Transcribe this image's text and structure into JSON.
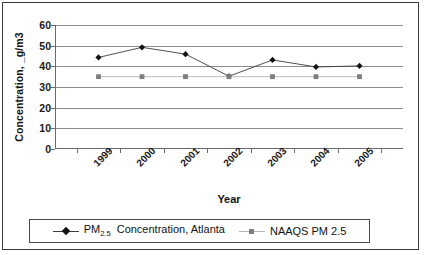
{
  "chart_data": {
    "type": "line",
    "title": "",
    "xlabel": "Year",
    "ylabel": "Concentration, _g/m3",
    "categories": [
      "1999",
      "2000",
      "2001",
      "2002",
      "2003",
      "2004",
      "2005"
    ],
    "ylim": [
      0,
      60
    ],
    "yticks": [
      0,
      10,
      20,
      30,
      40,
      50,
      60
    ],
    "grid": true,
    "legend_position": "bottom",
    "series": [
      {
        "name": "PM2.5 Concentration, Atlanta",
        "legend_label_main": "PM",
        "legend_label_sub": "2.5",
        "legend_label_rest": "Concentration, Atlanta",
        "marker": "diamond",
        "color": "#121212",
        "values": [
          44.3,
          49.2,
          45.9,
          35.2,
          43.1,
          39.7,
          40.2
        ]
      },
      {
        "name": "NAAQS PM 2.5",
        "legend_label_main": "NAAQS PM 2.5",
        "marker": "square",
        "color": "#7d7d7d",
        "values": [
          35.0,
          35.0,
          35.0,
          35.0,
          35.0,
          35.0,
          35.0
        ]
      }
    ]
  },
  "colors": {
    "frame": "#3a3a3a",
    "gridline": "#8c8c8c",
    "axis": "#6b6b6b",
    "series_pm": "#121212",
    "series_naaqs": "#7d7d7d"
  }
}
